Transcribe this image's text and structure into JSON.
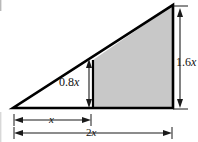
{
  "figure": {
    "type": "geometry-diagram",
    "background_color": "#ffffff",
    "shape_fill_color": "#c8c8c8",
    "stroke_color": "#000000",
    "dimension_line_color": "#1a1a1a",
    "labels": {
      "left_height": "0.8x",
      "right_height": "1.6x",
      "partial_base": "x",
      "full_base": "2x"
    },
    "label_parts": {
      "left_height_num": "0.8",
      "left_height_var": "x",
      "right_height_num": "1.6",
      "right_height_var": "x",
      "partial_base_var": "x",
      "full_base_num": "2",
      "full_base_var": "x"
    },
    "geometry": {
      "apex": [
        173,
        5
      ],
      "bottom_left": [
        13,
        108
      ],
      "bottom_right": [
        173,
        108
      ],
      "divider_x": 93,
      "divider_top_y": 60,
      "baseline_y": 108
    },
    "dimension_lines": {
      "left_vertical": {
        "x": 89,
        "y_top": 61,
        "y_bottom": 107
      },
      "right_vertical": {
        "x": 180,
        "y_top": 8,
        "y_bottom": 108
      },
      "partial_base": {
        "y": 120,
        "x_left": 14,
        "x_right": 91
      },
      "full_base": {
        "y": 133,
        "x_left": 14,
        "x_right": 172
      }
    }
  }
}
